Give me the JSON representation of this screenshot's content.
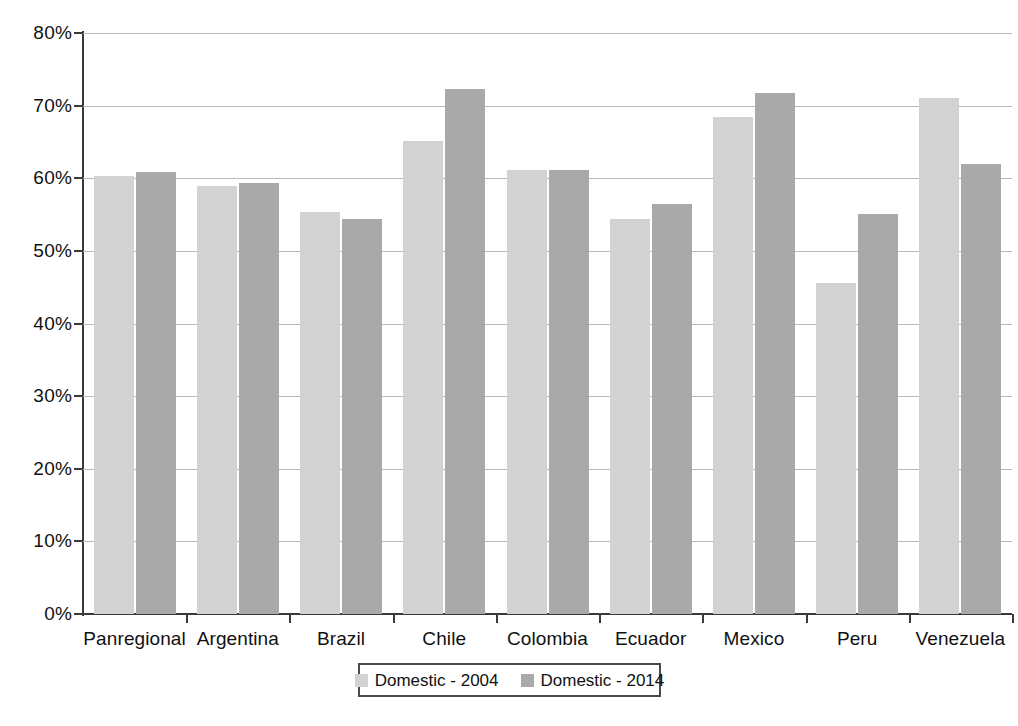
{
  "chart_data": {
    "type": "bar",
    "title": "",
    "subtitle": "",
    "xlabel": "",
    "ylabel": "",
    "ylim": [
      0,
      80
    ],
    "ytick_step": 10,
    "ytick_labels": [
      "0%",
      "10%",
      "20%",
      "30%",
      "40%",
      "50%",
      "60%",
      "70%",
      "80%"
    ],
    "ytick_values": [
      0,
      10,
      20,
      30,
      40,
      50,
      60,
      70,
      80
    ],
    "grid": true,
    "grid_axis": "y",
    "legend_position": "bottom",
    "value_suffix": "%",
    "categories": [
      "Panregional",
      "Argentina",
      "Brazil",
      "Chile",
      "Colombia",
      "Ecuador",
      "Mexico",
      "Peru",
      "Venezuela"
    ],
    "series": [
      {
        "name": "Domestic - 2004",
        "color": "#d2d2d2",
        "values": [
          60.3,
          58.9,
          55.3,
          65.2,
          61.1,
          54.4,
          68.4,
          45.6,
          71.1
        ]
      },
      {
        "name": "Domestic - 2014",
        "color": "#a9a9a9",
        "values": [
          60.8,
          59.3,
          54.4,
          72.3,
          61.1,
          56.4,
          71.8,
          55.1,
          62.0
        ]
      }
    ]
  },
  "legend": {
    "items": [
      {
        "label": "Domestic - 2004",
        "color": "#d2d2d2"
      },
      {
        "label": "Domestic - 2014",
        "color": "#a9a9a9"
      }
    ]
  },
  "colors": {
    "series_2004": "#d2d2d2",
    "series_2014": "#a9a9a9",
    "axis": "#3a3a3a",
    "gridline": "#b9b9b9",
    "background": "#ffffff",
    "text": "#111111"
  }
}
